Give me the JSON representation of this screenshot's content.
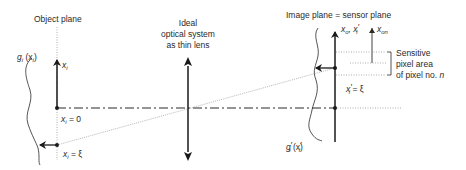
{
  "diagram": {
    "title_left": "Object plane",
    "lens_label": [
      "Ideal",
      "optical system",
      "as thin lens"
    ],
    "image_plane_label": "Image plane = sensor plane",
    "sensitive_area_label": [
      "Sensitive",
      "pixel area",
      "of pixel no. "
    ],
    "pixel_index": "n",
    "object_function": {
      "g": "g",
      "sub": "i",
      "arg_open": " (x",
      "arg_sub": "i",
      "arg_close": ")"
    },
    "image_function": {
      "g": "g",
      "prime": "′",
      "sub": "i",
      "arg_open": " (x",
      "arg_prime": "′",
      "arg_sub": "i",
      "arg_close": ")"
    },
    "object_axis_label": {
      "x": "x",
      "sub": "i"
    },
    "object_origin_label": {
      "x": "x",
      "sub": "i",
      "rest": " = 0"
    },
    "object_point_label": {
      "x": "x",
      "sub": "i",
      "rest": " = ξ"
    },
    "image_axis_label": {
      "x0": "x",
      "sub0": "o",
      "sep": ", ",
      "x1": "x",
      "prime": "′",
      "sub1": "i"
    },
    "pixel_axis_label": {
      "x": "x",
      "sub": "on"
    },
    "image_point_label": {
      "x": "x",
      "prime": "′",
      "sub": "i",
      "rest": " = ξ"
    },
    "colors": {
      "line": "#2a2a2a",
      "dotted": "#9a9a9a"
    }
  }
}
